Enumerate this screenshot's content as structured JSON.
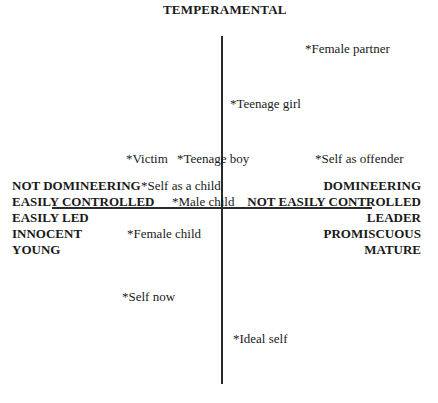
{
  "diagram": {
    "type": "repertory-grid-quadrant",
    "top_pole": "TEMPERAMENTAL",
    "left_pole": [
      "NOT DOMINEERING",
      "EASILY CONTROLLED",
      "EASILY LED",
      "INNOCENT",
      "YOUNG"
    ],
    "right_pole": [
      "DOMINEERING",
      "NOT EASILY CONTROLLED",
      "LEADER",
      "PROMISCUOUS",
      "MATURE"
    ],
    "points": [
      {
        "label": "*Female partner"
      },
      {
        "label": "*Teenage girl"
      },
      {
        "label": "*Victim"
      },
      {
        "label": "*Teenage boy"
      },
      {
        "label": "*Self as offender"
      },
      {
        "label": "*Self as a child"
      },
      {
        "label": "*Male child"
      },
      {
        "label": "*Female child"
      },
      {
        "label": "*Self now"
      },
      {
        "label": "*Ideal self"
      }
    ]
  }
}
